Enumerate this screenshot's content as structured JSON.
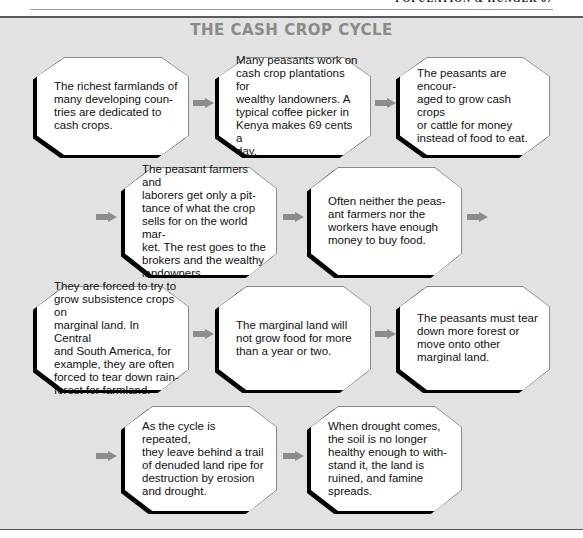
{
  "page": {
    "running_head": "POPULATION & HUNGER   67"
  },
  "diagram": {
    "title": "THE CASH CROP CYCLE",
    "colors": {
      "panel": "#e2e2e2",
      "arrow": "#8c8c8c",
      "title": "#8a8a8a",
      "box_shadow": "#000000"
    },
    "steps": [
      {
        "id": 1,
        "text": "The richest farmlands of\nmany developing coun-\ntries are dedicated to\ncash crops."
      },
      {
        "id": 2,
        "text": "Many peasants work on\ncash crop plantations for\nwealthy landowners. A\ntypical coffee picker in\nKenya makes 69 cents a\nday."
      },
      {
        "id": 3,
        "text": "The peasants are encour-\naged to grow cash crops\nor cattle for money\ninstead of food to eat."
      },
      {
        "id": 4,
        "text": "The peasant farmers and\nlaborers get only a pit-\ntance of what the crop\nsells for on the world mar-\nket. The rest goes to the\nbrokers and the wealthy\nlandowners."
      },
      {
        "id": 5,
        "text": "Often neither the peas-\nant farmers nor the\nworkers have enough\nmoney to buy food."
      },
      {
        "id": 6,
        "text": "They are forced to try to\ngrow subsistence crops on\nmarginal land. In Central\nand South America, for\nexample, they are often\nforced to tear down rain-\nforest for farmland."
      },
      {
        "id": 7,
        "text": "The marginal land will\nnot grow food for more\nthan a year or two."
      },
      {
        "id": 8,
        "text": "The peasants must tear\ndown more forest or\nmove onto other\nmarginal land."
      },
      {
        "id": 9,
        "text": "As the cycle is repeated,\nthey leave behind a trail\nof denuded land ripe for\ndestruction by erosion\nand drought."
      },
      {
        "id": 10,
        "text": "When drought comes,\nthe soil is no longer\nhealthy enough to with-\nstand it, the land is\nruined, and famine\nspreads."
      }
    ]
  }
}
